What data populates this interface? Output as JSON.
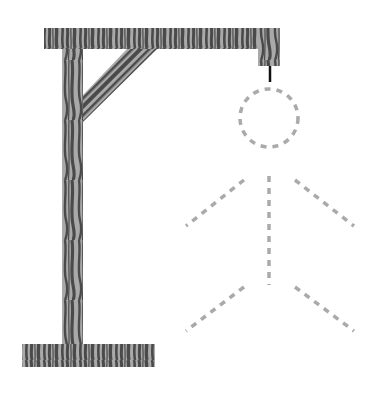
{
  "game": {
    "name": "hangman",
    "gallows": {
      "wood_light": "#a9a9a9",
      "wood_dark": "#4a4a4a",
      "rope_color": "#111111",
      "top_beam": {
        "x": 44,
        "y": 28,
        "w": 236,
        "h": 21
      },
      "post": {
        "x": 62,
        "y": 28,
        "w": 21,
        "h": 320
      },
      "base": {
        "x": 22,
        "y": 344,
        "w": 133,
        "h": 23
      },
      "hook_block": {
        "x": 258,
        "y": 28,
        "w": 22,
        "h": 38
      },
      "brace": [
        [
          83,
          95
        ],
        [
          127,
          49
        ],
        [
          157,
          49
        ],
        [
          83,
          122
        ]
      ],
      "rope": {
        "x": 270,
        "y1": 66,
        "y2": 82
      }
    },
    "figure": {
      "style": "dashed-outline",
      "color": "#aaaaaa",
      "parts": {
        "head": {
          "cx": 269,
          "cy": 118,
          "r": 29,
          "revealed": false
        },
        "body": {
          "x1": 269,
          "y1": 176,
          "x2": 269,
          "y2": 285,
          "revealed": false
        },
        "left_arm": {
          "x1": 244,
          "y1": 180,
          "x2": 186,
          "y2": 226,
          "revealed": false
        },
        "right_arm": {
          "x1": 295,
          "y1": 180,
          "x2": 354,
          "y2": 226,
          "revealed": false
        },
        "left_leg": {
          "x1": 244,
          "y1": 287,
          "x2": 186,
          "y2": 331,
          "revealed": false
        },
        "right_leg": {
          "x1": 295,
          "y1": 287,
          "x2": 354,
          "y2": 331,
          "revealed": false
        }
      }
    },
    "wrong_guesses": 0
  }
}
